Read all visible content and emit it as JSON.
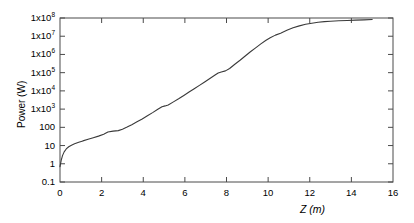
{
  "chart_data": {
    "type": "line",
    "title": "",
    "xlabel": "Z (m)",
    "ylabel": "Power (W)",
    "xlim": [
      0,
      16
    ],
    "ylim": [
      0.1,
      100000000
    ],
    "yscale": "log",
    "xscale": "linear",
    "grid": false,
    "legend": null,
    "xticks": [
      0,
      2,
      4,
      6,
      8,
      10,
      12,
      14,
      16
    ],
    "xtick_labels": [
      "0",
      "2",
      "4",
      "6",
      "8",
      "10",
      "12",
      "14",
      "16"
    ],
    "yticks": [
      0.1,
      1,
      10,
      100,
      1000,
      10000,
      100000,
      1000000,
      10000000,
      100000000
    ],
    "ytick_labels": [
      "0.1",
      "1",
      "10",
      "100",
      "1x10³",
      "1x10⁴",
      "1x10⁵",
      "1x10⁶",
      "1x10⁷",
      "1x10⁸"
    ],
    "ytick_mantissa": [
      "0.1",
      "1",
      "10",
      "100",
      "1x10",
      "1x10",
      "1x10",
      "1x10",
      "1x10",
      "1x10"
    ],
    "ytick_exponent": [
      "",
      "",
      "",
      "",
      "3",
      "4",
      "5",
      "6",
      "7",
      "8"
    ],
    "line_color": "#3a3a3a",
    "line_width": 1.1,
    "series": [
      {
        "name": "Power along Z",
        "x": [
          0.0,
          0.06,
          0.12,
          0.2,
          0.3,
          0.42,
          0.55,
          0.7,
          0.9,
          1.1,
          1.35,
          1.6,
          1.85,
          2.1,
          2.3,
          2.55,
          2.8,
          3.0,
          3.2,
          3.45,
          3.7,
          3.95,
          4.2,
          4.45,
          4.7,
          4.9,
          5.05,
          5.2,
          5.45,
          5.7,
          5.95,
          6.2,
          6.45,
          6.7,
          6.95,
          7.2,
          7.45,
          7.6,
          7.75,
          7.95,
          8.15,
          8.4,
          8.65,
          8.9,
          9.15,
          9.4,
          9.65,
          9.9,
          10.1,
          10.35,
          10.6,
          10.9,
          11.2,
          11.5,
          11.8,
          12.1,
          12.4,
          12.7,
          13.0,
          13.4,
          13.8,
          14.2,
          14.6,
          15.0
        ],
        "y": [
          0.7,
          1.6,
          2.8,
          4.5,
          6.5,
          8.6,
          10.5,
          12.5,
          15.0,
          18.0,
          22.0,
          27.0,
          33.0,
          42.0,
          55.0,
          62.0,
          66.0,
          78.0,
          100.0,
          140.0,
          200.0,
          290.0,
          430.0,
          640.0,
          980.0,
          1350.0,
          1500.0,
          1700.0,
          2500.0,
          3700.0,
          5600.0,
          8600.0,
          13000.0,
          20000.0,
          31000.0,
          48000.0,
          74000.0,
          95000.0,
          110000.0,
          125000.0,
          170000.0,
          290000.0,
          480000.0,
          820000.0,
          1400000.0,
          2300000.0,
          3800000.0,
          6000000.0,
          8200000.0,
          11500000.0,
          14500000.0,
          21000000.0,
          29000000.0,
          37000000.0,
          45000000.0,
          52000000.0,
          58000000.0,
          63000000.0,
          66000000.0,
          70000000.0,
          73000000.0,
          76000000.0,
          79000000.0,
          82000000.0
        ]
      }
    ]
  },
  "axes": {
    "plot_left_px": 60,
    "plot_right_px": 393,
    "plot_top_px": 18,
    "plot_bottom_px": 182
  }
}
